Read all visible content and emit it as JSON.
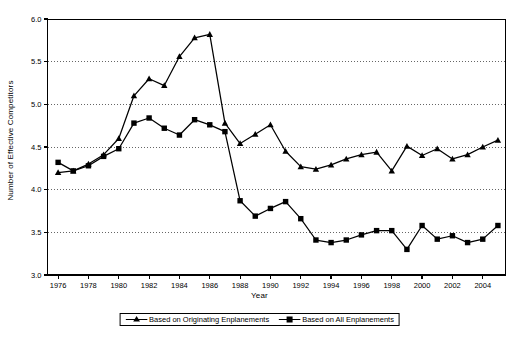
{
  "chart_data": {
    "type": "line",
    "title": "",
    "xlabel": "Year",
    "ylabel": "Number of Effective Competitors",
    "xlim": [
      1975.3,
      2005.5
    ],
    "ylim": [
      3.0,
      6.0
    ],
    "ytick_labels": [
      "3.0",
      "3.5",
      "4.0",
      "4.5",
      "5.0",
      "5.5",
      "6.0"
    ],
    "yticks": [
      3.0,
      3.5,
      4.0,
      4.5,
      5.0,
      5.5,
      6.0
    ],
    "xtick_labels": [
      "1976",
      "1978",
      "1980",
      "1982",
      "1984",
      "1986",
      "1988",
      "1990",
      "1992",
      "1994",
      "1996",
      "1998",
      "2000",
      "2002",
      "2004"
    ],
    "xticks": [
      1976,
      1978,
      1980,
      1982,
      1984,
      1986,
      1988,
      1990,
      1992,
      1994,
      1996,
      1998,
      2000,
      2002,
      2004
    ],
    "grid": "horizontal-dotted",
    "legend_position": "below-axis-center",
    "x": [
      1976,
      1977,
      1978,
      1979,
      1980,
      1981,
      1982,
      1983,
      1984,
      1985,
      1986,
      1987,
      1988,
      1989,
      1990,
      1991,
      1992,
      1993,
      1994,
      1995,
      1996,
      1997,
      1998,
      1999,
      2000,
      2001,
      2002,
      2003,
      2004,
      2005
    ],
    "series": [
      {
        "name": "Based on Originating Enplanements",
        "marker": "triangle",
        "color": "#000000",
        "values": [
          4.2,
          4.22,
          4.3,
          4.41,
          4.6,
          5.1,
          5.3,
          5.22,
          5.56,
          5.78,
          5.82,
          4.78,
          4.54,
          4.65,
          4.76,
          4.45,
          4.27,
          4.24,
          4.29,
          4.36,
          4.41,
          4.44,
          4.22,
          4.51,
          4.4,
          4.48,
          4.36,
          4.41,
          4.5,
          4.58
        ]
      },
      {
        "name": "Based on All Enplanements",
        "marker": "square",
        "color": "#000000",
        "values": [
          4.32,
          4.22,
          4.28,
          4.39,
          4.48,
          4.78,
          4.84,
          4.72,
          4.64,
          4.82,
          4.76,
          4.68,
          3.87,
          3.69,
          3.78,
          3.86,
          3.66,
          3.41,
          3.38,
          3.41,
          3.47,
          3.52,
          3.52,
          3.3,
          3.58,
          3.42,
          3.46,
          3.38,
          3.42,
          3.58
        ]
      }
    ]
  },
  "legend": {
    "items": [
      {
        "label": "Based on Originating Enplanements",
        "marker": "triangle"
      },
      {
        "label": "Based on All Enplanements",
        "marker": "square"
      }
    ]
  }
}
